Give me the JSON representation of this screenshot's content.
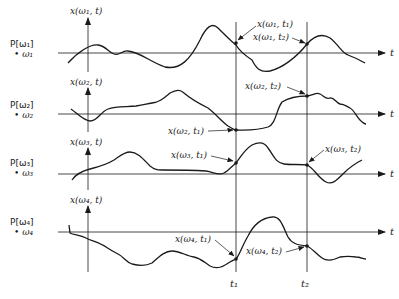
{
  "figure": {
    "time_axis_label": "t",
    "t1_label": "t₁",
    "t2_label": "t₂",
    "colors": {
      "ink": "#1a1a1a",
      "background": "#ffffff"
    }
  },
  "rows": [
    {
      "prob_label": "P[ω₁]",
      "outcome_label": "• ω₁",
      "y_axis_label": "x(ω₁, t)",
      "sample_t1_label": "x(ω₁, t₁)",
      "sample_t2_label": "x(ω₁, t₂)"
    },
    {
      "prob_label": "P[ω₂]",
      "outcome_label": "• ω₂",
      "y_axis_label": "x(ω₂, t)",
      "sample_t1_label": "x(ω₂, t₁)",
      "sample_t2_label": "x(ω₂, t₂)"
    },
    {
      "prob_label": "P[ω₃]",
      "outcome_label": "• ω₃",
      "y_axis_label": "x(ω₃, t)",
      "sample_t1_label": "x(ω₃, t₁)",
      "sample_t2_label": "x(ω₃, t₂)"
    },
    {
      "prob_label": "P[ω₄]",
      "outcome_label": "• ω₄",
      "y_axis_label": "x(ω₄, t)",
      "sample_t1_label": "x(ω₄, t₁)",
      "sample_t2_label": "x(ω₄, t₂)"
    }
  ]
}
